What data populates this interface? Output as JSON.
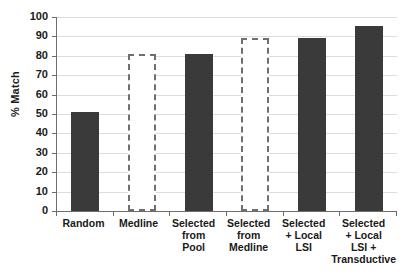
{
  "chart_data": {
    "type": "bar",
    "title": "",
    "xlabel": "",
    "ylabel": "% Match",
    "ylim": [
      0,
      100
    ],
    "ytick_step": 10,
    "grid": true,
    "legend": "none",
    "categories": [
      "Random",
      "Medline",
      "Selected from Pool",
      "Selected from Medline",
      "Selected + Local LSI",
      "Selected + Local LSI + Transductive"
    ],
    "category_lines": [
      [
        "Random"
      ],
      [
        "Medline"
      ],
      [
        "Selected",
        "from",
        "Pool"
      ],
      [
        "Selected",
        "from",
        "Medline"
      ],
      [
        "Selected",
        "+ Local",
        "LSI"
      ],
      [
        "Selected",
        "+ Local",
        "LSI +",
        "Transductive"
      ]
    ],
    "values": [
      51,
      81,
      81,
      89,
      89,
      95.5
    ],
    "bar_styles": [
      "solid",
      "outline",
      "solid",
      "outline",
      "solid",
      "solid"
    ],
    "ytick_labels": [
      "100",
      "90",
      "80",
      "70",
      "60",
      "50",
      "40",
      "30",
      "20",
      "10",
      "0"
    ],
    "colors": {
      "bar_fill": "#3a3a3a",
      "bar_outline_stroke": "#6f6f6f",
      "gridline": "#dcdcdc",
      "axis": "#6d6d6d",
      "text": "#1a1a1a",
      "background": "#ffffff"
    }
  }
}
